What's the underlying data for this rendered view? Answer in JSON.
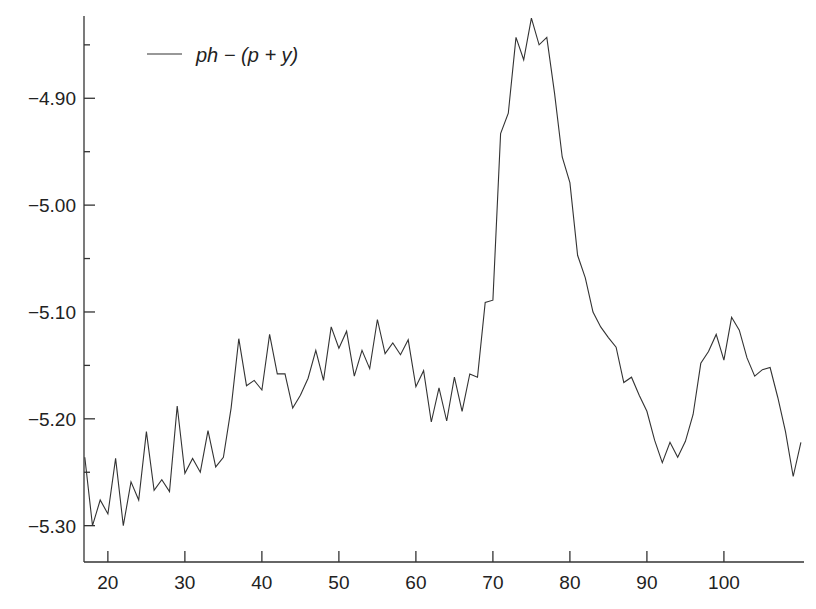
{
  "chart_data": {
    "type": "line",
    "title": "",
    "xlabel": "",
    "ylabel": "",
    "xlim": [
      16.9,
      110.4
    ],
    "ylim": [
      -5.334,
      -4.823
    ],
    "grid": false,
    "legend_position": "top-left",
    "x_ticks": [
      20,
      30,
      40,
      50,
      60,
      70,
      80,
      90,
      100
    ],
    "x_tick_labels": [
      "20",
      "30",
      "40",
      "50",
      "60",
      "70",
      "80",
      "90",
      "100"
    ],
    "y_ticks": [
      -4.9,
      -5.0,
      -5.1,
      -5.2,
      -5.3
    ],
    "y_tick_labels": [
      "−4.90",
      "−5.00",
      "−5.10",
      "−5.20",
      "−5.30"
    ],
    "y_minor_ticks": [
      -4.85,
      -4.95,
      -5.05,
      -5.15,
      -5.25
    ],
    "series": [
      {
        "name": "ph − (p + y)",
        "color": "#333333",
        "x": [
          17,
          18,
          19,
          20,
          21,
          22,
          23,
          24,
          25,
          26,
          27,
          28,
          29,
          30,
          31,
          32,
          33,
          34,
          35,
          36,
          37,
          38,
          39,
          40,
          41,
          42,
          43,
          44,
          45,
          46,
          47,
          48,
          49,
          50,
          51,
          52,
          53,
          54,
          55,
          56,
          57,
          58,
          59,
          60,
          61,
          62,
          63,
          64,
          65,
          66,
          67,
          68,
          69,
          70,
          71,
          72,
          73,
          74,
          75,
          76,
          77,
          78,
          79,
          80,
          81,
          82,
          83,
          84,
          85,
          86,
          87,
          88,
          89,
          90,
          91,
          92,
          93,
          94,
          95,
          96,
          97,
          98,
          99,
          100,
          101,
          102,
          103,
          104,
          105,
          106,
          107,
          108,
          109,
          110
        ],
        "values": [
          -5.236,
          -5.3,
          -5.276,
          -5.289,
          -5.237,
          -5.3,
          -5.259,
          -5.276,
          -5.212,
          -5.267,
          -5.257,
          -5.268,
          -5.188,
          -5.251,
          -5.237,
          -5.25,
          -5.211,
          -5.245,
          -5.236,
          -5.19,
          -5.125,
          -5.169,
          -5.164,
          -5.173,
          -5.121,
          -5.158,
          -5.158,
          -5.19,
          -5.178,
          -5.162,
          -5.136,
          -5.164,
          -5.114,
          -5.134,
          -5.118,
          -5.16,
          -5.136,
          -5.153,
          -5.107,
          -5.139,
          -5.129,
          -5.14,
          -5.126,
          -5.17,
          -5.155,
          -5.203,
          -5.171,
          -5.202,
          -5.161,
          -5.193,
          -5.158,
          -5.161,
          -5.091,
          -5.089,
          -4.933,
          -4.914,
          -4.843,
          -4.864,
          -4.825,
          -4.85,
          -4.843,
          -4.895,
          -4.955,
          -4.979,
          -5.047,
          -5.068,
          -5.1,
          -5.114,
          -5.124,
          -5.133,
          -5.166,
          -5.161,
          -5.178,
          -5.193,
          -5.22,
          -5.241,
          -5.222,
          -5.236,
          -5.221,
          -5.196,
          -5.148,
          -5.137,
          -5.121,
          -5.145,
          -5.105,
          -5.117,
          -5.143,
          -5.16,
          -5.154,
          -5.152,
          -5.18,
          -5.212,
          -5.254,
          -5.222
        ]
      }
    ]
  },
  "legend": {
    "label": "ph − (p + y)"
  }
}
